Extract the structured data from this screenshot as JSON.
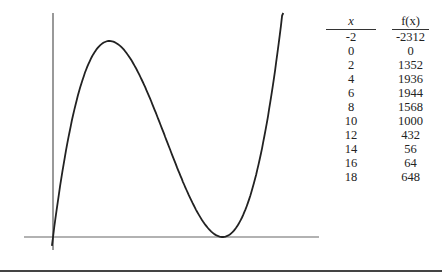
{
  "chart_data": {
    "type": "line",
    "title": "",
    "xlabel": "",
    "ylabel": "",
    "function": "f(x) = 4x(x-15)^2",
    "curve_x_range": [
      -0.1,
      20.8
    ],
    "grid": false,
    "legend": null,
    "table": {
      "headers": [
        "x",
        "f(x)"
      ],
      "x": [
        -2,
        0,
        2,
        4,
        6,
        8,
        10,
        12,
        14,
        16,
        18
      ],
      "fx": [
        -2312,
        0,
        1352,
        1936,
        1944,
        1568,
        1000,
        432,
        56,
        64,
        648
      ]
    }
  },
  "table": {
    "header_x": "x",
    "header_fx": "f(x)",
    "rows": [
      {
        "x": "-2",
        "fx": "-2312"
      },
      {
        "x": "0",
        "fx": "0"
      },
      {
        "x": "2",
        "fx": "1352"
      },
      {
        "x": "4",
        "fx": "1936"
      },
      {
        "x": "6",
        "fx": "1944"
      },
      {
        "x": "8",
        "fx": "1568"
      },
      {
        "x": "10",
        "fx": "1000"
      },
      {
        "x": "12",
        "fx": "432"
      },
      {
        "x": "14",
        "fx": "56"
      },
      {
        "x": "16",
        "fx": "64"
      },
      {
        "x": "18",
        "fx": "648"
      }
    ]
  },
  "colors": {
    "curve": "#222222",
    "axes": "#555555"
  }
}
